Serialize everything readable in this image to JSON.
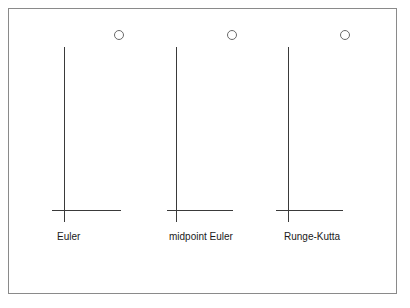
{
  "diagram": {
    "panels": [
      {
        "label": "Euler",
        "circle": {
          "cx": 119,
          "cy": 35
        },
        "vline": {
          "x": 64,
          "y1": 47,
          "y2": 222
        },
        "hline": {
          "y": 210,
          "x1": 52,
          "x2": 121
        },
        "label_pos": {
          "x": 57,
          "y": 231
        }
      },
      {
        "label": "midpoint Euler",
        "circle": {
          "cx": 232,
          "cy": 35
        },
        "vline": {
          "x": 176,
          "y1": 47,
          "y2": 222
        },
        "hline": {
          "y": 210,
          "x1": 167,
          "x2": 233
        },
        "label_pos": {
          "x": 169,
          "y": 231
        }
      },
      {
        "label": "Runge-Kutta",
        "circle": {
          "cx": 345,
          "cy": 35
        },
        "vline": {
          "x": 288,
          "y1": 47,
          "y2": 222
        },
        "hline": {
          "y": 210,
          "x1": 276,
          "x2": 343
        },
        "label_pos": {
          "x": 284,
          "y": 231
        }
      }
    ],
    "colors": {
      "frame": "#8a8a8a",
      "lines": "#3a3a3a",
      "circle": "#6a6a6a",
      "text": "#1a1a1a"
    }
  }
}
